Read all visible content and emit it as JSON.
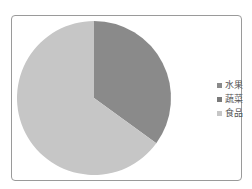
{
  "chart_data": {
    "type": "pie",
    "title": "",
    "categories": [
      "水果",
      "蔬菜",
      "食品"
    ],
    "values": [
      35,
      0,
      65
    ],
    "colors": [
      "#8a8a8a",
      "#7a7a7a",
      "#c6c6c6"
    ],
    "legend_position": "right"
  },
  "legend": {
    "items": [
      {
        "label": "水果",
        "color": "#8a8a8a"
      },
      {
        "label": "蔬菜",
        "color": "#7a7a7a"
      },
      {
        "label": "食品",
        "color": "#c6c6c6"
      }
    ]
  }
}
